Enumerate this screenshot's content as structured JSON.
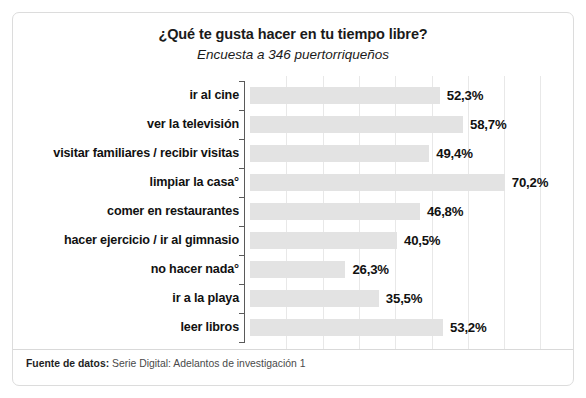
{
  "card": {
    "title": "¿Qué te gusta hacer en tu tiempo libre?",
    "subtitle": "Encuesta a 346 puertorriqueños"
  },
  "footer": {
    "source_label": "Fuente de datos:",
    "source_text": " Serie Digital: Adelantos de investigación 1"
  },
  "colors": {
    "bar_fill": "#e3e3e3",
    "gridline": "#e8e8e8",
    "axis": "#5a5a5a",
    "text": "#111111",
    "card_border": "#dcdcdc"
  },
  "chart_data": {
    "type": "bar",
    "orientation": "horizontal",
    "title": "¿Qué te gusta hacer en tu tiempo libre?",
    "subtitle": "Encuesta a 346 puertorriqueños",
    "xlabel": "",
    "ylabel": "",
    "xlim": [
      0,
      80
    ],
    "xtick_step": 10,
    "grid": "vertical",
    "legend": "none",
    "value_suffix": "%",
    "decimal_separator": ",",
    "sample_size": 346,
    "categories": [
      "ir al cine",
      "ver la televisión",
      "visitar familiares / recibir visitas",
      "limpiar la casa°",
      "comer en restaurantes",
      "hacer ejercicio / ir al gimnasio",
      "no hacer nada°",
      "ir a la playa",
      "leer libros"
    ],
    "values": [
      52.3,
      58.7,
      49.4,
      70.2,
      46.8,
      40.5,
      26.3,
      35.5,
      53.2
    ],
    "value_labels": [
      "52,3%",
      "58,7%",
      "49,4%",
      "70,2%",
      "46,8%",
      "40,5%",
      "26,3%",
      "35,5%",
      "53,2%"
    ]
  }
}
